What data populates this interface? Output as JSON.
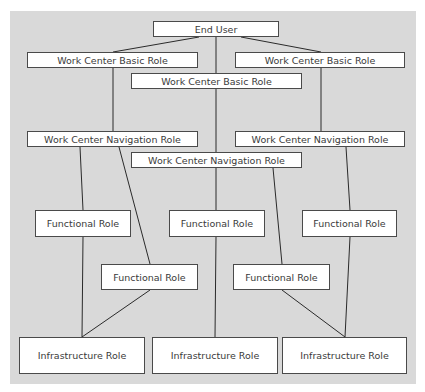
{
  "diagram": {
    "type": "role-hierarchy",
    "nodes": [
      {
        "id": "end-user",
        "label": "End User",
        "level": "user"
      },
      {
        "id": "wcbr-left",
        "label": "Work Center Basic Role",
        "level": "basic"
      },
      {
        "id": "wcbr-mid",
        "label": "Work Center Basic Role",
        "level": "basic"
      },
      {
        "id": "wcbr-right",
        "label": "Work Center Basic Role",
        "level": "basic"
      },
      {
        "id": "wcnr-left",
        "label": "Work Center Navigation Role",
        "level": "navigation"
      },
      {
        "id": "wcnr-mid",
        "label": "Work Center Navigation Role",
        "level": "navigation"
      },
      {
        "id": "wcnr-right",
        "label": "Work Center Navigation Role",
        "level": "navigation"
      },
      {
        "id": "fr-left",
        "label": "Functional Role",
        "level": "functional"
      },
      {
        "id": "fr-mid",
        "label": "Functional Role",
        "level": "functional"
      },
      {
        "id": "fr-right",
        "label": "Functional Role",
        "level": "functional"
      },
      {
        "id": "fr-lower-left",
        "label": "Functional Role",
        "level": "functional"
      },
      {
        "id": "fr-lower-right",
        "label": "Functional Role",
        "level": "functional"
      },
      {
        "id": "ir-left",
        "label": "Infrastructure Role",
        "level": "infrastructure"
      },
      {
        "id": "ir-mid",
        "label": "Infrastructure Role",
        "level": "infrastructure"
      },
      {
        "id": "ir-right",
        "label": "Infrastructure Role",
        "level": "infrastructure"
      }
    ],
    "edges": [
      [
        "end-user",
        "wcbr-left"
      ],
      [
        "end-user",
        "wcbr-mid"
      ],
      [
        "end-user",
        "wcbr-right"
      ],
      [
        "wcbr-left",
        "wcnr-left"
      ],
      [
        "wcbr-mid",
        "wcnr-mid"
      ],
      [
        "wcbr-right",
        "wcnr-right"
      ],
      [
        "wcnr-left",
        "fr-left"
      ],
      [
        "wcnr-left",
        "fr-lower-left"
      ],
      [
        "wcnr-mid",
        "fr-mid"
      ],
      [
        "wcnr-mid",
        "fr-lower-right"
      ],
      [
        "wcnr-right",
        "fr-right"
      ],
      [
        "fr-left",
        "ir-left"
      ],
      [
        "fr-lower-left",
        "ir-left"
      ],
      [
        "fr-mid",
        "ir-mid"
      ],
      [
        "fr-lower-right",
        "ir-right"
      ],
      [
        "fr-right",
        "ir-right"
      ]
    ],
    "colors": {
      "background": "#d9d9d9",
      "node_fill": "#ffffff",
      "node_border": "#4a4a4a",
      "text": "#3a3a3a",
      "line": "#2a2a2a"
    }
  }
}
